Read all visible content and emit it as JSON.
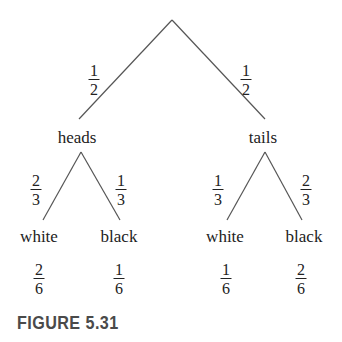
{
  "diagram": {
    "root": {
      "branches": [
        {
          "label": "heads",
          "prob": {
            "num": "1",
            "den": "2"
          },
          "children": [
            {
              "label": "white",
              "prob": {
                "num": "2",
                "den": "3"
              },
              "joint": {
                "num": "2",
                "den": "6"
              }
            },
            {
              "label": "black",
              "prob": {
                "num": "1",
                "den": "3"
              },
              "joint": {
                "num": "1",
                "den": "6"
              }
            }
          ]
        },
        {
          "label": "tails",
          "prob": {
            "num": "1",
            "den": "2"
          },
          "children": [
            {
              "label": "white",
              "prob": {
                "num": "1",
                "den": "3"
              },
              "joint": {
                "num": "1",
                "den": "6"
              }
            },
            {
              "label": "black",
              "prob": {
                "num": "2",
                "den": "3"
              },
              "joint": {
                "num": "2",
                "den": "6"
              }
            }
          ]
        }
      ]
    }
  },
  "caption": "FIGURE 5.31",
  "colors": {
    "line": "#555555",
    "text": "#222222",
    "caption": "#4a4a4a"
  }
}
